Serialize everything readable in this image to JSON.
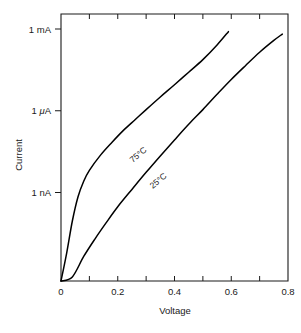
{
  "chart_data": {
    "type": "line",
    "title": "",
    "xlabel": "Voltage",
    "ylabel": "Current",
    "yscale": "log",
    "xlim": [
      0,
      0.8
    ],
    "ylim_labels": [
      "1 nA",
      "1 μA",
      "1 mA"
    ],
    "grid": false,
    "legend_position": "inline-curve-labels",
    "x_ticks_major": [
      "0",
      "0.2",
      "0.4",
      "0.6",
      "0.8"
    ],
    "x_tick_values_major": [
      0,
      0.2,
      0.4,
      0.6,
      0.8
    ],
    "x_tick_values_minor": [
      0.1,
      0.3,
      0.5,
      0.7
    ],
    "y_ticks": [
      {
        "label": "1 mA",
        "value_amps": 0.001
      },
      {
        "label": "1 μA",
        "value_amps": 1e-06
      },
      {
        "label": "1 nA",
        "value_amps": 1e-09
      }
    ],
    "series": [
      {
        "name": "75 °C",
        "label": "75°C",
        "color": "#000000",
        "points": [
          {
            "v": 0.0,
            "i_amps": 1e-13
          },
          {
            "v": 0.02,
            "i_amps": 6e-12
          },
          {
            "v": 0.04,
            "i_amps": 9e-11
          },
          {
            "v": 0.06,
            "i_amps": 7e-10
          },
          {
            "v": 0.08,
            "i_amps": 2.6e-09
          },
          {
            "v": 0.1,
            "i_amps": 6.5e-09
          },
          {
            "v": 0.14,
            "i_amps": 2.4e-08
          },
          {
            "v": 0.18,
            "i_amps": 7e-08
          },
          {
            "v": 0.22,
            "i_amps": 1.9e-07
          },
          {
            "v": 0.26,
            "i_amps": 4.6e-07
          },
          {
            "v": 0.3,
            "i_amps": 1.1e-06
          },
          {
            "v": 0.35,
            "i_amps": 3.2e-06
          },
          {
            "v": 0.4,
            "i_amps": 9e-06
          },
          {
            "v": 0.45,
            "i_amps": 2.6e-05
          },
          {
            "v": 0.5,
            "i_amps": 7.5e-05
          },
          {
            "v": 0.55,
            "i_amps": 0.00026
          },
          {
            "v": 0.59,
            "i_amps": 0.0008
          }
        ]
      },
      {
        "name": "25 °C",
        "label": "25°C",
        "color": "#000000",
        "points": [
          {
            "v": 0.0,
            "i_amps": 1e-13
          },
          {
            "v": 0.04,
            "i_amps": 8e-13
          },
          {
            "v": 0.08,
            "i_amps": 4.5e-12
          },
          {
            "v": 0.12,
            "i_amps": 2e-11
          },
          {
            "v": 0.16,
            "i_amps": 8e-11
          },
          {
            "v": 0.2,
            "i_amps": 3e-10
          },
          {
            "v": 0.25,
            "i_amps": 1.3e-09
          },
          {
            "v": 0.3,
            "i_amps": 5.5e-09
          },
          {
            "v": 0.35,
            "i_amps": 2.2e-08
          },
          {
            "v": 0.4,
            "i_amps": 8.5e-08
          },
          {
            "v": 0.45,
            "i_amps": 3.2e-07
          },
          {
            "v": 0.5,
            "i_amps": 1.1e-06
          },
          {
            "v": 0.55,
            "i_amps": 4e-06
          },
          {
            "v": 0.6,
            "i_amps": 1.4e-05
          },
          {
            "v": 0.65,
            "i_amps": 4.5e-05
          },
          {
            "v": 0.7,
            "i_amps": 0.00014
          },
          {
            "v": 0.75,
            "i_amps": 0.00038
          },
          {
            "v": 0.78,
            "i_amps": 0.00065
          }
        ]
      }
    ]
  },
  "axes": {
    "y_title": "Current",
    "x_title": "Voltage"
  },
  "style": {
    "axis_color": "#1a1a1a",
    "curve_color": "#000000",
    "background": "#ffffff"
  }
}
